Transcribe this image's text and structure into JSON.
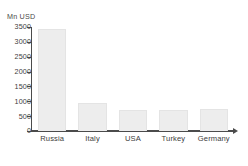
{
  "chart_data": {
    "type": "bar",
    "title": "",
    "subtitle": "",
    "xlabel": "",
    "ylabel": "Mn USD",
    "unit_label": "Mn USD",
    "categories": [
      "Russia",
      "Italy",
      "USA",
      "Turkey",
      "Germany"
    ],
    "values": [
      3450,
      930,
      710,
      715,
      725
    ],
    "series": [
      {
        "name": "Mn USD",
        "values": [
          3450,
          930,
          710,
          715,
          725
        ]
      }
    ],
    "ylim": [
      0,
      3500
    ],
    "ytick_values": [
      0,
      500,
      1000,
      1500,
      2000,
      2500,
      3000,
      3500
    ],
    "ytick_labels": [
      "0",
      "500",
      "1000",
      "1500",
      "2000",
      "2500",
      "3000",
      "3500"
    ],
    "grid": false,
    "legend": false,
    "legend_position": "none",
    "bar_color": "#ededed",
    "bar_border_color": "#e4e4e4",
    "axis_color": "#4b4b4b",
    "text_color": "#3c3c3c",
    "background_color": "#ffffff"
  }
}
